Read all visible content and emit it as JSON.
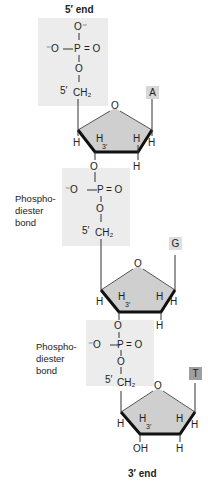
{
  "header": {
    "title": "5′ end"
  },
  "footer": {
    "title": "3′ end"
  },
  "colors": {
    "phosphate_panel": "#ececec",
    "sugar_fill": "#cfcfcf",
    "sugar_bond": "#111111",
    "base_box_A": "#d7d7d7",
    "base_box_G": "#dedede",
    "base_box_T": "#9e9e9e"
  },
  "atoms": {
    "O_minus": "O⁻",
    "minus_O": "⁻O",
    "P": "P",
    "O": "O",
    "eq_O": "= O",
    "CH2": "CH₂",
    "five_prime": "5′",
    "three_prime": "3′",
    "H": "H",
    "OH": "OH"
  },
  "nucleotides": [
    {
      "base": "A",
      "phosphate": "5′ terminal phosphate"
    },
    {
      "base": "G",
      "phosphate_label": [
        "Phospho-",
        "diester",
        "bond"
      ]
    },
    {
      "base": "T",
      "phosphate_label": [
        "Phospho-",
        "diester",
        "bond"
      ]
    }
  ],
  "bond_labels": [
    {
      "line1": "Phospho-",
      "line2": "diester",
      "line3": "bond"
    },
    {
      "line1": "Phospho-",
      "line2": "diester",
      "line3": "bond"
    }
  ]
}
